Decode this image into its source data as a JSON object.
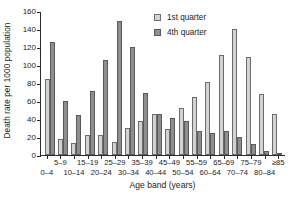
{
  "chart_data": {
    "type": "bar",
    "title": "",
    "xlabel": "Age band (years)",
    "ylabel": "Death rate per 1000 population",
    "ylim": [
      0,
      160
    ],
    "yticks": [
      0,
      20,
      40,
      60,
      80,
      100,
      120,
      140,
      160
    ],
    "grid": false,
    "legend_position": "top-right",
    "categories": [
      "0–4",
      "5–9",
      "10–14",
      "15–19",
      "20–24",
      "25–29",
      "30–34",
      "35–39",
      "40–44",
      "45–49",
      "50–54",
      "55–59",
      "60–64",
      "65–69",
      "70–74",
      "75–79",
      "80–84",
      "≥85"
    ],
    "series": [
      {
        "name": "1st quarter",
        "color": "#d2d2d2",
        "values": [
          85,
          18,
          13,
          22,
          22,
          14,
          30,
          38,
          46,
          29,
          52,
          64,
          81,
          111,
          140,
          109,
          68,
          46
        ]
      },
      {
        "name": "4th quarter",
        "color": "#8e8e8e",
        "values": [
          126,
          60,
          45,
          71,
          106,
          149,
          120,
          69,
          46,
          41,
          38,
          27,
          24,
          27,
          20,
          12,
          5,
          2
        ]
      }
    ]
  },
  "legend": {
    "items": [
      {
        "label": "1st quarter",
        "swatch": "light-gray-swatch"
      },
      {
        "label": "4th quarter",
        "swatch": "dark-gray-swatch"
      }
    ]
  }
}
